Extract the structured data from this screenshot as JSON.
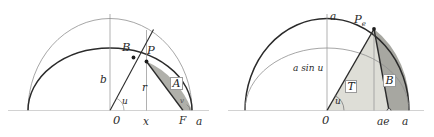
{
  "figure": {
    "background_color": "#ffffff",
    "ink_color": "#2b2b2b",
    "thin_color": "#8a8a8a",
    "shade_light": "#d9d9d2",
    "shade_mid": "#bdbdb6",
    "shade_dark": "#9a9a95"
  },
  "left_panel": {
    "name": "ellipse-anomaly-panel",
    "labels": {
      "origin": "0",
      "abscissa": "x",
      "focus": "F",
      "semi_major": "a",
      "semi_minor": "b",
      "radius": "r",
      "angle": "u",
      "point_circle": "B",
      "point_ellipse": "P",
      "area_region": "A",
      "angle_small": "v"
    }
  },
  "right_panel": {
    "name": "eccentric-anomaly-panel",
    "labels": {
      "origin": "0",
      "apex": "a",
      "semi_major": "a",
      "focus_abscissa": "ae",
      "angle": "u",
      "point_circle": "P",
      "point_circle_sub": "e",
      "ordinate": "a sin u",
      "triangle_region": "T",
      "sector_region": "B"
    }
  }
}
